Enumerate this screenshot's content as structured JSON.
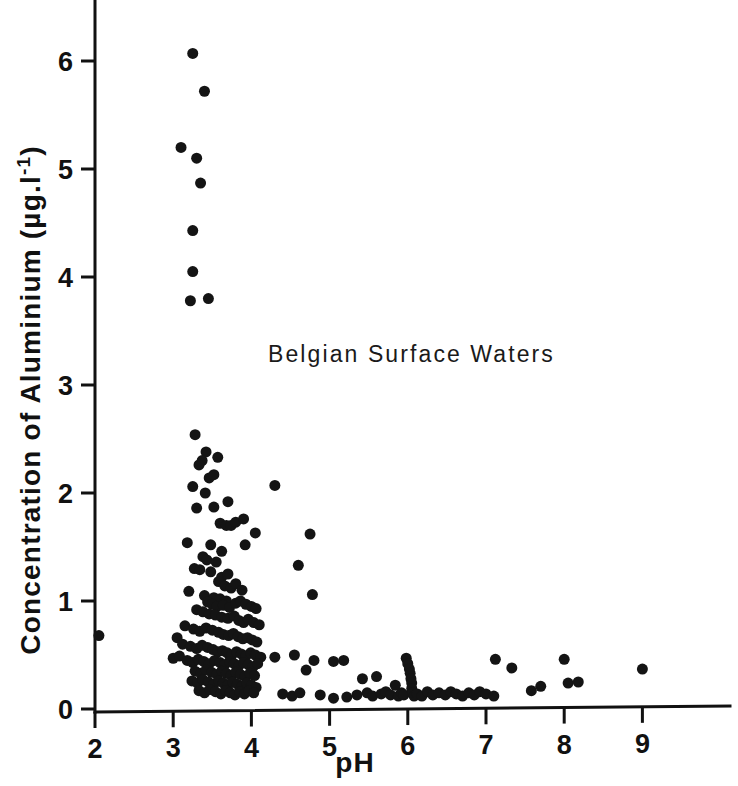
{
  "chart_data": {
    "type": "scatter",
    "title": "",
    "annotation": "Belgian Surface Waters",
    "xlabel": "pH",
    "ylabel": "Concentration of Aluminium (µg.l",
    "ylabel_superscript": "-1",
    "ylabel_suffix": ")",
    "ylabel_full": "Concentration of Aluminium (µg.l⁻¹)",
    "xlim": [
      1.55,
      9.45
    ],
    "ylim": [
      -0.12,
      6.45
    ],
    "xticks": [
      2,
      3,
      4,
      5,
      6,
      7,
      8,
      9
    ],
    "yticks": [
      0,
      1,
      2,
      3,
      4,
      5,
      6
    ],
    "xtick_labels": [
      "2",
      "3",
      "4",
      "5",
      "6",
      "7",
      "8",
      "9"
    ],
    "ytick_labels": [
      "0",
      "1",
      "2",
      "3",
      "4",
      "5",
      "6"
    ],
    "grid": false,
    "legend": null,
    "marker": "filled-circle",
    "marker_color": "#141414",
    "marker_size_px": 11,
    "n_points": 214,
    "points": [
      [
        2.05,
        0.68
      ],
      [
        3.25,
        6.07
      ],
      [
        3.4,
        5.72
      ],
      [
        3.1,
        5.2
      ],
      [
        3.3,
        5.1
      ],
      [
        3.35,
        4.87
      ],
      [
        3.25,
        4.43
      ],
      [
        3.25,
        4.05
      ],
      [
        3.22,
        3.78
      ],
      [
        3.45,
        3.8
      ],
      [
        3.28,
        2.54
      ],
      [
        3.42,
        2.38
      ],
      [
        3.37,
        2.3
      ],
      [
        3.33,
        2.26
      ],
      [
        3.57,
        2.33
      ],
      [
        3.46,
        2.14
      ],
      [
        3.52,
        2.17
      ],
      [
        3.25,
        2.06
      ],
      [
        3.41,
        2.0
      ],
      [
        4.3,
        2.07
      ],
      [
        3.3,
        1.86
      ],
      [
        3.52,
        1.87
      ],
      [
        3.7,
        1.92
      ],
      [
        3.6,
        1.72
      ],
      [
        3.68,
        1.7
      ],
      [
        3.74,
        1.7
      ],
      [
        3.8,
        1.73
      ],
      [
        3.9,
        1.76
      ],
      [
        4.05,
        1.63
      ],
      [
        4.75,
        1.62
      ],
      [
        3.18,
        1.54
      ],
      [
        3.48,
        1.52
      ],
      [
        3.62,
        1.46
      ],
      [
        3.92,
        1.52
      ],
      [
        3.38,
        1.41
      ],
      [
        3.43,
        1.38
      ],
      [
        3.55,
        1.36
      ],
      [
        4.6,
        1.33
      ],
      [
        3.27,
        1.3
      ],
      [
        3.34,
        1.29
      ],
      [
        3.48,
        1.27
      ],
      [
        3.62,
        1.22
      ],
      [
        3.7,
        1.25
      ],
      [
        3.58,
        1.18
      ],
      [
        3.66,
        1.14
      ],
      [
        3.74,
        1.12
      ],
      [
        3.8,
        1.16
      ],
      [
        3.88,
        1.1
      ],
      [
        4.78,
        1.06
      ],
      [
        3.2,
        1.09
      ],
      [
        3.4,
        1.05
      ],
      [
        3.52,
        1.03
      ],
      [
        3.6,
        1.02
      ],
      [
        3.68,
        1.0
      ],
      [
        3.44,
        0.99
      ],
      [
        3.5,
        0.97
      ],
      [
        3.56,
        0.95
      ],
      [
        3.64,
        0.96
      ],
      [
        3.72,
        0.94
      ],
      [
        3.8,
        0.98
      ],
      [
        3.86,
        1.0
      ],
      [
        3.93,
        0.97
      ],
      [
        4.0,
        0.95
      ],
      [
        4.06,
        0.93
      ],
      [
        3.3,
        0.92
      ],
      [
        3.38,
        0.9
      ],
      [
        3.46,
        0.88
      ],
      [
        3.54,
        0.87
      ],
      [
        3.62,
        0.85
      ],
      [
        3.7,
        0.84
      ],
      [
        3.78,
        0.86
      ],
      [
        3.84,
        0.82
      ],
      [
        3.9,
        0.8
      ],
      [
        3.96,
        0.83
      ],
      [
        4.03,
        0.8
      ],
      [
        4.1,
        0.78
      ],
      [
        3.15,
        0.77
      ],
      [
        3.26,
        0.74
      ],
      [
        3.34,
        0.72
      ],
      [
        3.42,
        0.75
      ],
      [
        3.5,
        0.73
      ],
      [
        3.58,
        0.71
      ],
      [
        3.64,
        0.69
      ],
      [
        3.71,
        0.68
      ],
      [
        3.77,
        0.7
      ],
      [
        3.83,
        0.67
      ],
      [
        3.89,
        0.65
      ],
      [
        3.95,
        0.66
      ],
      [
        4.01,
        0.64
      ],
      [
        4.07,
        0.62
      ],
      [
        3.05,
        0.66
      ],
      [
        3.12,
        0.6
      ],
      [
        3.22,
        0.58
      ],
      [
        3.3,
        0.56
      ],
      [
        3.37,
        0.59
      ],
      [
        3.44,
        0.57
      ],
      [
        3.51,
        0.55
      ],
      [
        3.57,
        0.53
      ],
      [
        3.63,
        0.54
      ],
      [
        3.69,
        0.52
      ],
      [
        3.75,
        0.5
      ],
      [
        3.81,
        0.53
      ],
      [
        3.87,
        0.51
      ],
      [
        3.93,
        0.49
      ],
      [
        3.99,
        0.52
      ],
      [
        4.05,
        0.5
      ],
      [
        4.12,
        0.48
      ],
      [
        3.0,
        0.47
      ],
      [
        3.08,
        0.49
      ],
      [
        3.18,
        0.45
      ],
      [
        3.25,
        0.43
      ],
      [
        3.32,
        0.46
      ],
      [
        3.39,
        0.44
      ],
      [
        3.46,
        0.42
      ],
      [
        3.53,
        0.45
      ],
      [
        3.6,
        0.43
      ],
      [
        3.66,
        0.41
      ],
      [
        3.72,
        0.44
      ],
      [
        3.78,
        0.42
      ],
      [
        3.84,
        0.4
      ],
      [
        3.9,
        0.43
      ],
      [
        3.96,
        0.41
      ],
      [
        4.02,
        0.39
      ],
      [
        4.08,
        0.42
      ],
      [
        3.28,
        0.35
      ],
      [
        3.35,
        0.33
      ],
      [
        3.42,
        0.36
      ],
      [
        3.49,
        0.34
      ],
      [
        3.56,
        0.32
      ],
      [
        3.62,
        0.35
      ],
      [
        3.68,
        0.33
      ],
      [
        3.74,
        0.31
      ],
      [
        3.8,
        0.34
      ],
      [
        3.86,
        0.32
      ],
      [
        3.92,
        0.3
      ],
      [
        3.98,
        0.33
      ],
      [
        4.04,
        0.31
      ],
      [
        3.24,
        0.26
      ],
      [
        3.31,
        0.24
      ],
      [
        3.38,
        0.27
      ],
      [
        3.45,
        0.25
      ],
      [
        3.52,
        0.23
      ],
      [
        3.58,
        0.26
      ],
      [
        3.64,
        0.24
      ],
      [
        3.7,
        0.22
      ],
      [
        3.76,
        0.25
      ],
      [
        3.82,
        0.23
      ],
      [
        3.88,
        0.21
      ],
      [
        3.94,
        0.24
      ],
      [
        4.0,
        0.22
      ],
      [
        4.06,
        0.2
      ],
      [
        3.33,
        0.17
      ],
      [
        3.4,
        0.15
      ],
      [
        3.47,
        0.18
      ],
      [
        3.54,
        0.16
      ],
      [
        3.61,
        0.14
      ],
      [
        3.67,
        0.17
      ],
      [
        3.73,
        0.15
      ],
      [
        3.79,
        0.13
      ],
      [
        3.85,
        0.16
      ],
      [
        3.91,
        0.14
      ],
      [
        3.97,
        0.17
      ],
      [
        4.03,
        0.15
      ],
      [
        4.3,
        0.48
      ],
      [
        4.55,
        0.5
      ],
      [
        4.52,
        0.12
      ],
      [
        4.4,
        0.14
      ],
      [
        4.62,
        0.15
      ],
      [
        4.7,
        0.36
      ],
      [
        4.8,
        0.45
      ],
      [
        4.88,
        0.13
      ],
      [
        5.05,
        0.44
      ],
      [
        5.18,
        0.45
      ],
      [
        5.05,
        0.1
      ],
      [
        5.22,
        0.11
      ],
      [
        5.35,
        0.13
      ],
      [
        5.42,
        0.28
      ],
      [
        5.48,
        0.15
      ],
      [
        5.55,
        0.12
      ],
      [
        5.6,
        0.3
      ],
      [
        5.66,
        0.14
      ],
      [
        5.72,
        0.16
      ],
      [
        5.78,
        0.13
      ],
      [
        5.84,
        0.22
      ],
      [
        5.88,
        0.12
      ],
      [
        5.92,
        0.15
      ],
      [
        5.95,
        0.13
      ],
      [
        5.98,
        0.47
      ],
      [
        6.0,
        0.42
      ],
      [
        6.02,
        0.37
      ],
      [
        6.03,
        0.33
      ],
      [
        6.04,
        0.28
      ],
      [
        6.05,
        0.24
      ],
      [
        6.05,
        0.19
      ],
      [
        6.06,
        0.15
      ],
      [
        6.08,
        0.12
      ],
      [
        6.12,
        0.14
      ],
      [
        6.18,
        0.12
      ],
      [
        6.25,
        0.16
      ],
      [
        6.32,
        0.13
      ],
      [
        6.4,
        0.15
      ],
      [
        6.48,
        0.13
      ],
      [
        6.55,
        0.16
      ],
      [
        6.62,
        0.14
      ],
      [
        6.7,
        0.12
      ],
      [
        6.78,
        0.15
      ],
      [
        6.85,
        0.13
      ],
      [
        6.92,
        0.16
      ],
      [
        7.0,
        0.14
      ],
      [
        7.1,
        0.12
      ],
      [
        7.12,
        0.46
      ],
      [
        7.33,
        0.38
      ],
      [
        7.58,
        0.17
      ],
      [
        7.7,
        0.21
      ],
      [
        8.0,
        0.46
      ],
      [
        8.05,
        0.24
      ],
      [
        8.18,
        0.25
      ],
      [
        9.0,
        0.37
      ]
    ]
  }
}
